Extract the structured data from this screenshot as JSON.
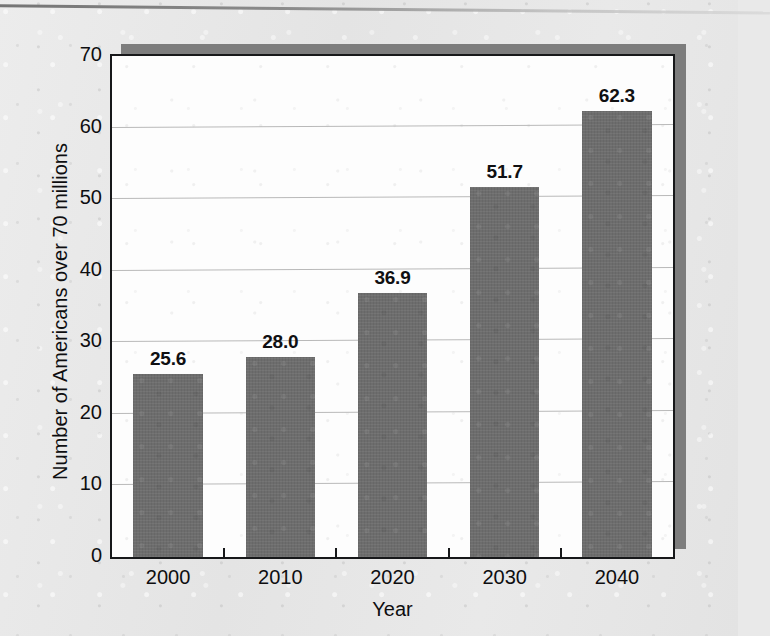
{
  "chart_data": {
    "type": "bar",
    "title": "",
    "subtitle": "",
    "xlabel": "Year",
    "ylabel": "Number of Americans over 70 millions",
    "categories": [
      "2000",
      "2010",
      "2020",
      "2030",
      "2040"
    ],
    "values": [
      25.6,
      28.0,
      36.9,
      51.7,
      62.3
    ],
    "data_labels": [
      "25.6",
      "28.0",
      "36.9",
      "51.7",
      "62.3"
    ],
    "ylim": [
      0,
      70
    ],
    "y_ticks": [
      0,
      10,
      20,
      30,
      40,
      50,
      60,
      70
    ],
    "y_tick_labels": [
      "0",
      "10",
      "20",
      "30",
      "40",
      "50",
      "60",
      "70"
    ],
    "grid": "horizontal",
    "legend": "none",
    "series": [
      {
        "name": "Americans over 70",
        "values": [
          25.6,
          28.0,
          36.9,
          51.7,
          62.3
        ]
      }
    ]
  },
  "colors": {
    "bar_fill": "#6d6d6d",
    "plot_background": "#fdfdfd",
    "page_background": "#e7e7e7",
    "axis_line": "#17181a",
    "gridline": "#b9b9b9",
    "shadow": "#7d7d7d",
    "text": "#0e0e10"
  }
}
